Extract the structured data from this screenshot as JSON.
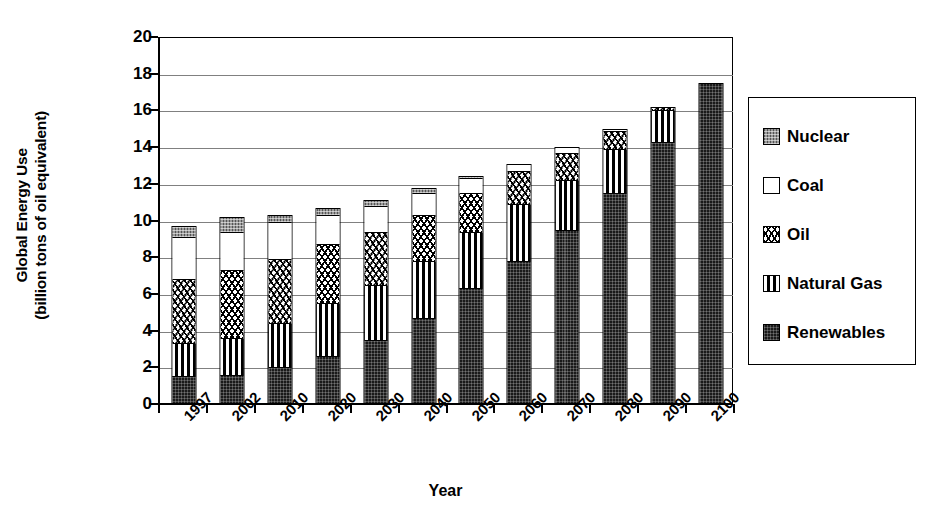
{
  "chart_data": {
    "type": "bar",
    "stacked": true,
    "title": "",
    "xlabel": "Year",
    "ylabel": "Global Energy Use (billion tons of oil equivalent)",
    "ylabel_line1": "Global Energy Use",
    "ylabel_line2": "(billion tons of oil equivalent)",
    "ylim": [
      0,
      20
    ],
    "ytick_step": 2,
    "ytick_labels": [
      "20",
      "18",
      "16",
      "14",
      "12",
      "10",
      "8",
      "6",
      "4",
      "2",
      "0"
    ],
    "grid": true,
    "grid_axis": "y",
    "legend_position": "right",
    "categories": [
      "1997",
      "2002",
      "2010",
      "2020",
      "2030",
      "2040",
      "2050",
      "2060",
      "2070",
      "2080",
      "2090",
      "2100"
    ],
    "series": [
      {
        "name": "Renewables",
        "pattern": "dense-dots-black",
        "color": "#1a1a1a",
        "values": [
          1.5,
          1.6,
          2.0,
          2.6,
          3.5,
          4.7,
          6.3,
          7.8,
          9.5,
          11.5,
          14.3,
          17.5
        ]
      },
      {
        "name": "Natural Gas",
        "pattern": "vertical-lines",
        "color": "#000000",
        "values": [
          1.8,
          2.0,
          2.4,
          2.9,
          3.0,
          3.1,
          3.1,
          3.1,
          2.7,
          2.4,
          1.7,
          0.0
        ]
      },
      {
        "name": "Oil",
        "pattern": "wavy",
        "color": "#ffffff",
        "values": [
          3.5,
          3.7,
          3.5,
          3.2,
          2.9,
          2.5,
          2.1,
          1.8,
          1.5,
          1.0,
          0.2,
          0.0
        ]
      },
      {
        "name": "Coal",
        "pattern": "solid-white",
        "color": "#ffffff",
        "values": [
          2.3,
          2.1,
          2.0,
          1.6,
          1.4,
          1.2,
          0.8,
          0.4,
          0.3,
          0.1,
          0.0,
          0.0
        ]
      },
      {
        "name": "Nuclear",
        "pattern": "gray-checker",
        "color": "#9a9a9a",
        "values": [
          0.6,
          0.8,
          0.4,
          0.4,
          0.3,
          0.25,
          0.1,
          0.0,
          0.0,
          0.0,
          0.0,
          0.0
        ]
      }
    ],
    "totals": [
      9.7,
      10.2,
      10.3,
      10.7,
      11.1,
      11.75,
      12.4,
      13.1,
      14.0,
      15.0,
      16.2,
      17.5
    ]
  },
  "legend": {
    "items": [
      {
        "label": "Nuclear",
        "fill_class": "f-nuclear"
      },
      {
        "label": "Coal",
        "fill_class": "f-coal"
      },
      {
        "label": "Oil",
        "fill_class": "f-oil"
      },
      {
        "label": "Natural Gas",
        "fill_class": "f-natgas"
      },
      {
        "label": "Renewables",
        "fill_class": "f-renewables"
      }
    ]
  }
}
